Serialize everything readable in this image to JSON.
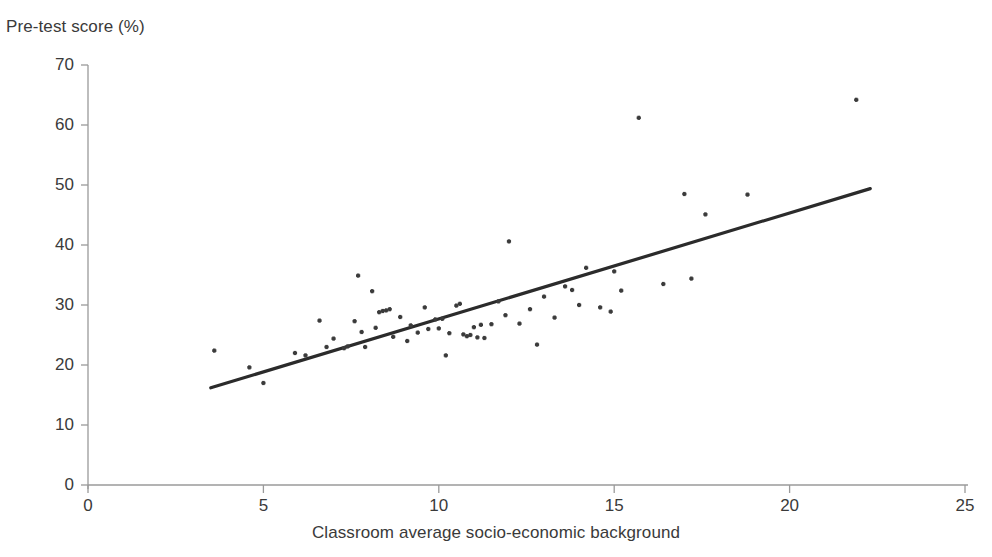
{
  "chart_data": {
    "type": "scatter",
    "title": "",
    "ylabel": "Pre-test score (%)",
    "xlabel": "Classroom average socio-economic background",
    "xlim": [
      0,
      25
    ],
    "ylim": [
      0,
      70
    ],
    "xticks": [
      0,
      5,
      10,
      15,
      20,
      25
    ],
    "yticks": [
      0,
      10,
      20,
      30,
      40,
      50,
      60,
      70
    ],
    "xtick_labels": [
      "0",
      "5",
      "10",
      "15",
      "20",
      "25"
    ],
    "ytick_labels": [
      "0",
      "10",
      "20",
      "30",
      "40",
      "50",
      "60",
      "70"
    ],
    "grid": false,
    "legend": null,
    "marker_color": "#3b3b3b",
    "trendline_color": "#2b2b2b",
    "axis_color": "#9a9a9a",
    "points": [
      [
        3.6,
        22.4
      ],
      [
        4.6,
        19.6
      ],
      [
        5.0,
        17.0
      ],
      [
        5.9,
        22.0
      ],
      [
        6.2,
        21.6
      ],
      [
        6.6,
        27.4
      ],
      [
        6.8,
        23.0
      ],
      [
        7.0,
        24.4
      ],
      [
        7.3,
        22.8
      ],
      [
        7.4,
        23.1
      ],
      [
        7.6,
        27.3
      ],
      [
        7.7,
        34.9
      ],
      [
        7.8,
        25.5
      ],
      [
        7.9,
        23.0
      ],
      [
        8.1,
        32.3
      ],
      [
        8.2,
        26.2
      ],
      [
        8.3,
        28.8
      ],
      [
        8.4,
        29.0
      ],
      [
        8.5,
        29.1
      ],
      [
        8.6,
        29.3
      ],
      [
        8.7,
        24.7
      ],
      [
        8.9,
        28.0
      ],
      [
        9.1,
        24.0
      ],
      [
        9.2,
        26.6
      ],
      [
        9.4,
        25.4
      ],
      [
        9.6,
        29.6
      ],
      [
        9.7,
        26.0
      ],
      [
        9.9,
        27.6
      ],
      [
        10.0,
        26.1
      ],
      [
        10.1,
        27.7
      ],
      [
        10.2,
        21.6
      ],
      [
        10.3,
        25.3
      ],
      [
        10.5,
        29.9
      ],
      [
        10.6,
        30.2
      ],
      [
        10.7,
        25.1
      ],
      [
        10.8,
        24.8
      ],
      [
        10.9,
        25.0
      ],
      [
        11.0,
        26.3
      ],
      [
        11.1,
        24.6
      ],
      [
        11.2,
        26.7
      ],
      [
        11.3,
        24.5
      ],
      [
        11.5,
        26.8
      ],
      [
        11.7,
        30.6
      ],
      [
        11.9,
        28.3
      ],
      [
        12.0,
        40.6
      ],
      [
        12.3,
        26.9
      ],
      [
        12.6,
        29.3
      ],
      [
        12.8,
        23.4
      ],
      [
        13.0,
        31.4
      ],
      [
        13.3,
        27.9
      ],
      [
        13.6,
        33.1
      ],
      [
        13.8,
        32.5
      ],
      [
        14.0,
        30.0
      ],
      [
        14.2,
        36.2
      ],
      [
        14.6,
        29.6
      ],
      [
        14.9,
        28.9
      ],
      [
        15.0,
        35.6
      ],
      [
        15.2,
        32.4
      ],
      [
        15.7,
        61.2
      ],
      [
        16.4,
        33.5
      ],
      [
        17.0,
        48.5
      ],
      [
        17.2,
        34.4
      ],
      [
        17.6,
        45.1
      ],
      [
        18.8,
        48.4
      ],
      [
        21.9,
        64.2
      ]
    ],
    "trendline": {
      "x1": 3.5,
      "y1": 16.2,
      "x2": 22.3,
      "y2": 49.4
    }
  }
}
